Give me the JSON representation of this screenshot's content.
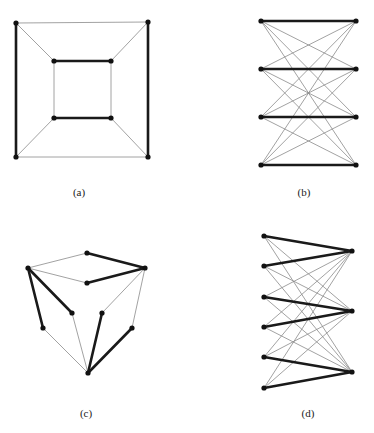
{
  "figure": {
    "panels": [
      {
        "id": "a",
        "label": "(a)",
        "label_pos": [
          79,
          193
        ],
        "description": "Cube graph drawn as nested squares with a perfect matching highlighted",
        "vertices": {
          "o_tl": [
            16,
            23
          ],
          "o_tr": [
            148,
            22
          ],
          "o_bl": [
            16,
            157
          ],
          "o_br": [
            148,
            157
          ],
          "i_tl": [
            54,
            61
          ],
          "i_tr": [
            111,
            61
          ],
          "i_bl": [
            54,
            118
          ],
          "i_br": [
            111,
            118
          ]
        },
        "edges": [
          {
            "from": "o_tl",
            "to": "o_tr",
            "thick": false
          },
          {
            "from": "o_bl",
            "to": "o_br",
            "thick": false
          },
          {
            "from": "o_tl",
            "to": "o_bl",
            "thick": true
          },
          {
            "from": "o_tr",
            "to": "o_br",
            "thick": true
          },
          {
            "from": "i_tl",
            "to": "i_tr",
            "thick": true
          },
          {
            "from": "i_bl",
            "to": "i_br",
            "thick": true
          },
          {
            "from": "i_tl",
            "to": "i_bl",
            "thick": false
          },
          {
            "from": "i_tr",
            "to": "i_br",
            "thick": false
          },
          {
            "from": "o_tl",
            "to": "i_tl",
            "thick": false
          },
          {
            "from": "o_tr",
            "to": "i_tr",
            "thick": false
          },
          {
            "from": "o_bl",
            "to": "i_bl",
            "thick": false
          },
          {
            "from": "o_br",
            "to": "i_br",
            "thick": false
          }
        ]
      },
      {
        "id": "b",
        "label": "(b)",
        "label_pos": [
          304,
          193
        ],
        "description": "Complete bipartite graph K4,4 with horizontal perfect matching highlighted",
        "vertices": {
          "L1": [
            261,
            21
          ],
          "L2": [
            261,
            69
          ],
          "L3": [
            261,
            117
          ],
          "L4": [
            261,
            165
          ],
          "R1": [
            356,
            21
          ],
          "R2": [
            356,
            69
          ],
          "R3": [
            356,
            117
          ],
          "R4": [
            356,
            165
          ]
        },
        "edges": [
          {
            "from": "L1",
            "to": "R1",
            "thick": true
          },
          {
            "from": "L2",
            "to": "R2",
            "thick": true
          },
          {
            "from": "L3",
            "to": "R3",
            "thick": true
          },
          {
            "from": "L4",
            "to": "R4",
            "thick": true
          },
          {
            "from": "L1",
            "to": "R2",
            "thick": false
          },
          {
            "from": "L1",
            "to": "R3",
            "thick": false
          },
          {
            "from": "L1",
            "to": "R4",
            "thick": false
          },
          {
            "from": "L2",
            "to": "R1",
            "thick": false
          },
          {
            "from": "L2",
            "to": "R3",
            "thick": false
          },
          {
            "from": "L2",
            "to": "R4",
            "thick": false
          },
          {
            "from": "L3",
            "to": "R1",
            "thick": false
          },
          {
            "from": "L3",
            "to": "R2",
            "thick": false
          },
          {
            "from": "L3",
            "to": "R4",
            "thick": false
          },
          {
            "from": "L4",
            "to": "R1",
            "thick": false
          },
          {
            "from": "L4",
            "to": "R2",
            "thick": false
          },
          {
            "from": "L4",
            "to": "R3",
            "thick": false
          }
        ]
      },
      {
        "id": "c",
        "label": "(c)",
        "label_pos": [
          86,
          414
        ],
        "description": "Cube-like graph drawing with highlighted edges",
        "vertices": {
          "top": [
            87,
            253
          ],
          "left": [
            28,
            268
          ],
          "right": [
            145,
            268
          ],
          "center": [
            87,
            283
          ],
          "innerL": [
            72,
            313
          ],
          "innerR": [
            102,
            313
          ],
          "lowerL": [
            43,
            328
          ],
          "lowerR": [
            132,
            328
          ],
          "bottom": [
            88,
            373
          ]
        },
        "edges": [
          {
            "from": "top",
            "to": "left",
            "thick": false
          },
          {
            "from": "top",
            "to": "right",
            "thick": true
          },
          {
            "from": "left",
            "to": "center",
            "thick": false
          },
          {
            "from": "center",
            "to": "right",
            "thick": true
          },
          {
            "from": "left",
            "to": "lowerL",
            "thick": true
          },
          {
            "from": "left",
            "to": "innerL",
            "thick": true
          },
          {
            "from": "right",
            "to": "innerR",
            "thick": false
          },
          {
            "from": "right",
            "to": "lowerR",
            "thick": false
          },
          {
            "from": "innerL",
            "to": "bottom",
            "thick": false
          },
          {
            "from": "lowerL",
            "to": "bottom",
            "thick": false
          },
          {
            "from": "innerR",
            "to": "bottom",
            "thick": true
          },
          {
            "from": "lowerR",
            "to": "bottom",
            "thick": true
          }
        ]
      },
      {
        "id": "d",
        "label": "(d)",
        "label_pos": [
          308,
          414
        ],
        "description": "Complete bipartite graph K3,6 with highlighted edges pairing left vertices to right vertices",
        "vertices": {
          "L1": [
            264,
            236
          ],
          "L2": [
            264,
            266
          ],
          "L3": [
            264,
            297
          ],
          "L4": [
            264,
            327
          ],
          "L5": [
            264,
            357
          ],
          "L6": [
            264,
            388
          ],
          "R1": [
            352,
            251
          ],
          "R2": [
            352,
            311
          ],
          "R3": [
            352,
            372
          ]
        },
        "edges": [
          {
            "from": "L1",
            "to": "R1",
            "thick": true
          },
          {
            "from": "L2",
            "to": "R1",
            "thick": true
          },
          {
            "from": "L3",
            "to": "R2",
            "thick": true
          },
          {
            "from": "L4",
            "to": "R2",
            "thick": true
          },
          {
            "from": "L5",
            "to": "R3",
            "thick": true
          },
          {
            "from": "L6",
            "to": "R3",
            "thick": true
          },
          {
            "from": "L1",
            "to": "R2",
            "thick": false
          },
          {
            "from": "L1",
            "to": "R3",
            "thick": false
          },
          {
            "from": "L2",
            "to": "R2",
            "thick": false
          },
          {
            "from": "L2",
            "to": "R3",
            "thick": false
          },
          {
            "from": "L3",
            "to": "R1",
            "thick": false
          },
          {
            "from": "L3",
            "to": "R3",
            "thick": false
          },
          {
            "from": "L4",
            "to": "R1",
            "thick": false
          },
          {
            "from": "L4",
            "to": "R3",
            "thick": false
          },
          {
            "from": "L5",
            "to": "R1",
            "thick": false
          },
          {
            "from": "L5",
            "to": "R2",
            "thick": false
          },
          {
            "from": "L6",
            "to": "R1",
            "thick": false
          },
          {
            "from": "L6",
            "to": "R2",
            "thick": false
          }
        ]
      }
    ]
  },
  "labels": {
    "a": "(a)",
    "b": "(b)",
    "c": "(c)",
    "d": "(d)"
  }
}
